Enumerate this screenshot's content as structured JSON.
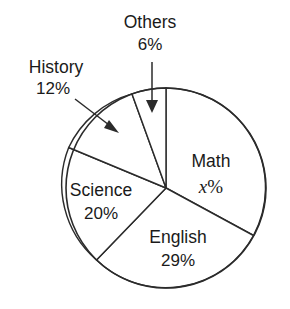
{
  "chart_data": {
    "type": "pie",
    "title": "",
    "subtitle": "",
    "xlabel": "",
    "ylabel": "",
    "legend_position": "none",
    "grid": false,
    "units": "%",
    "total_label": "100%",
    "categories": [
      "Math",
      "English",
      "Science",
      "History",
      "Others"
    ],
    "values": [
      33,
      29,
      20,
      12,
      6
    ],
    "slices": [
      {
        "name": "Math",
        "label": "Math",
        "value_text": "x%",
        "value_symbol": "x",
        "value_suffix": "%",
        "is_unknown": true,
        "value": 33,
        "start_angle_deg": 0,
        "end_angle_deg": 119,
        "label_placement": "inside"
      },
      {
        "name": "English",
        "label": "English",
        "value_text": "29%",
        "value": 29,
        "is_unknown": false,
        "start_angle_deg": 119,
        "end_angle_deg": 223,
        "label_placement": "inside"
      },
      {
        "name": "Science",
        "label": "Science",
        "value_text": "20%",
        "value": 20,
        "is_unknown": false,
        "start_angle_deg": 223,
        "end_angle_deg": 295,
        "label_placement": "inside"
      },
      {
        "name": "History",
        "label": "History",
        "value_text": "12%",
        "value": 12,
        "is_unknown": false,
        "start_angle_deg": 295,
        "end_angle_deg": 338,
        "label_placement": "outside-with-arrow"
      },
      {
        "name": "Others",
        "label": "Others",
        "value_text": "6%",
        "value": 6,
        "is_unknown": false,
        "start_angle_deg": 338,
        "end_angle_deg": 360,
        "label_placement": "outside-with-arrow"
      }
    ],
    "colors": {
      "slice_fill": "#ffffff",
      "stroke": "#2b2b2b",
      "text": "#1a1a1a",
      "background": "#ffffff"
    }
  },
  "figure": {
    "background": "#ffffff",
    "callouts": [
      {
        "name": "history-callout",
        "target": "History"
      },
      {
        "name": "others-callout",
        "target": "Others"
      }
    ]
  }
}
